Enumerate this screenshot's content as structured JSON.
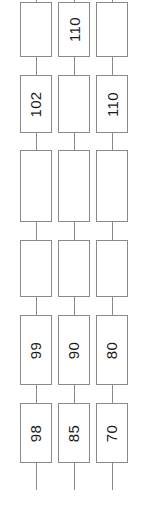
{
  "diagram": {
    "type": "linked-box-chain",
    "orientation": "vertical",
    "label_rotation_deg": -90,
    "colors": {
      "background": "#ffffff",
      "box_border": "#8a8a8a",
      "connector": "#8a8a8a",
      "label_text": "#1a1a1a"
    },
    "geometry": {
      "width": 143,
      "height": 529,
      "box_width": 32,
      "column_x": [
        20,
        58,
        96
      ],
      "row_tops": [
        2,
        75,
        150,
        240,
        315,
        403
      ],
      "row_heights": [
        55,
        58,
        72,
        57,
        70,
        60
      ],
      "top_stub_height": 2,
      "bottom_stub_height": 27
    },
    "columns": [
      {
        "name": "column-1",
        "nodes": [
          {
            "label": ""
          },
          {
            "label": "102"
          },
          {
            "label": ""
          },
          {
            "label": ""
          },
          {
            "label": "99"
          },
          {
            "label": "98"
          }
        ]
      },
      {
        "name": "column-2",
        "nodes": [
          {
            "label": "110"
          },
          {
            "label": ""
          },
          {
            "label": ""
          },
          {
            "label": ""
          },
          {
            "label": "90"
          },
          {
            "label": "85"
          }
        ]
      },
      {
        "name": "column-3",
        "nodes": [
          {
            "label": ""
          },
          {
            "label": "110"
          },
          {
            "label": ""
          },
          {
            "label": ""
          },
          {
            "label": "80"
          },
          {
            "label": "70"
          }
        ]
      }
    ]
  }
}
